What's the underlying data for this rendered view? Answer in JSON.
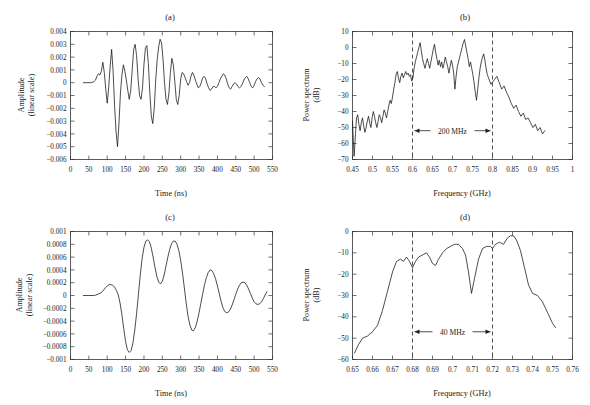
{
  "figure": {
    "panels": [
      {
        "id": "a",
        "title": "(a)"
      },
      {
        "id": "b",
        "title": "(b)"
      },
      {
        "id": "c",
        "title": "(c)"
      },
      {
        "id": "d",
        "title": "(d)"
      }
    ]
  },
  "axis_titles": {
    "time": "Time (ns)",
    "frequency": "Frequency (GHz)",
    "amplitude_line1": "Amplitude",
    "amplitude_line2": "(linear scale)",
    "power_line1": "Power spectrum",
    "power_line2": "(dB)"
  },
  "annotations": {
    "bandwidth_b": "200 MHz",
    "bandwidth_d": "40 MHz"
  },
  "chart_data": [
    {
      "type": "line",
      "panel": "a",
      "title": "(a)",
      "xlabel": "Time (ns)",
      "ylabel": "Amplitude (linear scale)",
      "xlim": [
        0,
        550
      ],
      "ylim": [
        -0.006,
        0.004
      ],
      "xticks": [
        0,
        50,
        100,
        150,
        200,
        250,
        300,
        350,
        400,
        450,
        500,
        550
      ],
      "xtick_labels": [
        "0",
        "50",
        "100",
        "150",
        "200",
        "250",
        "300",
        "350",
        "400",
        "450",
        "500",
        "550"
      ],
      "yticks": [
        -0.006,
        -0.005,
        -0.004,
        -0.003,
        -0.002,
        -0.001,
        0,
        0.001,
        0.002,
        0.003,
        0.004
      ],
      "ytick_labels": [
        "-0.006",
        "-0.005",
        "-0.004",
        "-0.003",
        "-0.002",
        "-0.001",
        "0",
        "0.001",
        "0.002",
        "0.003",
        "0.004"
      ],
      "grid": false,
      "legend": "none",
      "x": [
        35,
        45,
        55,
        62,
        68,
        72,
        76,
        80,
        84,
        88,
        92,
        96,
        100,
        104,
        108,
        112,
        116,
        120,
        124,
        128,
        132,
        136,
        140,
        144,
        148,
        152,
        156,
        160,
        164,
        168,
        172,
        176,
        180,
        184,
        188,
        192,
        196,
        200,
        204,
        208,
        212,
        216,
        220,
        224,
        228,
        232,
        236,
        240,
        244,
        248,
        252,
        256,
        260,
        264,
        268,
        272,
        276,
        280,
        284,
        288,
        292,
        296,
        300,
        304,
        308,
        312,
        316,
        320,
        324,
        328,
        332,
        336,
        340,
        344,
        348,
        352,
        356,
        360,
        364,
        368,
        372,
        376,
        380,
        384,
        388,
        392,
        396,
        400,
        404,
        408,
        412,
        416,
        420,
        424,
        428,
        432,
        436,
        440,
        444,
        448,
        452,
        456,
        460,
        464,
        468,
        472,
        476,
        480,
        484,
        488,
        492,
        496,
        500,
        504,
        508,
        512,
        516,
        520,
        524,
        528,
        532
      ],
      "y": [
        0,
        0,
        0,
        5e-05,
        0.0002,
        0.0005,
        0.0007,
        0.0006,
        0.0009,
        0.0016,
        0.0008,
        -0.0005,
        -0.0016,
        -0.0004,
        0.0013,
        0.0026,
        0.0009,
        -0.0018,
        -0.0038,
        -0.005,
        -0.0032,
        -0.0008,
        0.0006,
        0.0014,
        0.0009,
        0.0002,
        -0.0006,
        -0.0013,
        -0.0006,
        0.001,
        0.0026,
        0.003,
        0.0021,
        0.0003,
        -0.001,
        -0.0013,
        -0.0004,
        0.0014,
        0.0027,
        0.0029,
        0.0015,
        -0.0008,
        -0.0026,
        -0.0032,
        -0.002,
        0.0002,
        0.0018,
        0.0028,
        0.0034,
        0.0031,
        0.0018,
        0.0,
        -0.0013,
        -0.0017,
        -0.0008,
        0.0008,
        0.0019,
        0.0014,
        0.0001,
        -0.0013,
        -0.0017,
        -0.001,
        0.0003,
        0.0008,
        0.0007,
        0.0004,
        0.0001,
        -0.0002,
        0.0,
        0.0005,
        0.0008,
        0.0006,
        0.0002,
        -0.0001,
        -0.0004,
        -0.0003,
        0.0,
        0.0004,
        0.0005,
        0.0003,
        -0.0001,
        -0.0004,
        -0.0006,
        -0.0005,
        -0.0003,
        -0.0003,
        -0.0004,
        -0.0003,
        0.0,
        0.0003,
        0.0005,
        0.0007,
        0.0006,
        0.0003,
        -0.0001,
        -0.0004,
        -0.0005,
        -0.0003,
        -0.0001,
        0.0,
        -0.0001,
        -0.0003,
        -0.0004,
        -0.0003,
        -0.0001,
        0.0002,
        0.0004,
        0.0005,
        0.0003,
        0.0,
        -0.0003,
        -0.0004,
        -0.0002,
        0.0001,
        0.0003,
        0.0004,
        0.0003,
        0.0,
        -0.0002,
        -0.0003
      ]
    },
    {
      "type": "line",
      "panel": "b",
      "title": "(b)",
      "xlabel": "Frequency (GHz)",
      "ylabel": "Power spectrum (dB)",
      "xlim": [
        0.45,
        1.0
      ],
      "ylim": [
        -70,
        10
      ],
      "xticks": [
        0.45,
        0.5,
        0.55,
        0.6,
        0.65,
        0.7,
        0.75,
        0.8,
        0.85,
        0.9,
        0.95,
        1
      ],
      "xtick_labels": [
        "0.45",
        "0.5",
        "0.55",
        "0.6",
        "0.65",
        "0.7",
        "0.75",
        "0.8",
        "0.85",
        "0.9",
        "0.95",
        "1"
      ],
      "yticks": [
        -70,
        -60,
        -50,
        -40,
        -30,
        -20,
        -10,
        0,
        10
      ],
      "ytick_labels": [
        "-70",
        "-60",
        "-50",
        "-40",
        "-30",
        "-20",
        "-10",
        "0",
        "10"
      ],
      "grid": false,
      "legend": "none",
      "markers": {
        "dashed_x": [
          0.6,
          0.8
        ],
        "band_label": "200 MHz",
        "band_label_y": -52
      },
      "x": [
        0.45,
        0.452,
        0.454,
        0.456,
        0.458,
        0.46,
        0.463,
        0.466,
        0.469,
        0.472,
        0.475,
        0.478,
        0.481,
        0.484,
        0.487,
        0.49,
        0.493,
        0.496,
        0.499,
        0.502,
        0.505,
        0.508,
        0.511,
        0.514,
        0.517,
        0.52,
        0.523,
        0.526,
        0.529,
        0.532,
        0.535,
        0.538,
        0.541,
        0.544,
        0.547,
        0.55,
        0.553,
        0.556,
        0.559,
        0.562,
        0.565,
        0.568,
        0.571,
        0.574,
        0.577,
        0.58,
        0.583,
        0.586,
        0.589,
        0.592,
        0.595,
        0.598,
        0.601,
        0.604,
        0.607,
        0.61,
        0.613,
        0.616,
        0.619,
        0.622,
        0.625,
        0.628,
        0.631,
        0.634,
        0.637,
        0.64,
        0.643,
        0.646,
        0.649,
        0.652,
        0.655,
        0.658,
        0.661,
        0.664,
        0.667,
        0.67,
        0.673,
        0.676,
        0.679,
        0.682,
        0.685,
        0.688,
        0.691,
        0.694,
        0.697,
        0.7,
        0.703,
        0.706,
        0.709,
        0.712,
        0.715,
        0.718,
        0.721,
        0.724,
        0.727,
        0.73,
        0.733,
        0.736,
        0.739,
        0.742,
        0.745,
        0.748,
        0.751,
        0.754,
        0.757,
        0.76,
        0.763,
        0.766,
        0.769,
        0.772,
        0.775,
        0.778,
        0.781,
        0.784,
        0.787,
        0.79,
        0.793,
        0.796,
        0.799,
        0.805,
        0.811,
        0.817,
        0.823,
        0.829,
        0.835,
        0.841,
        0.847,
        0.853,
        0.859,
        0.865,
        0.871,
        0.877,
        0.883,
        0.889,
        0.895,
        0.901,
        0.907,
        0.913,
        0.919,
        0.925,
        0.931,
        0.937,
        0.943,
        0.949
      ],
      "y": [
        -46,
        -58,
        -68,
        -60,
        -52,
        -44,
        -42,
        -48,
        -52,
        -47,
        -44,
        -49,
        -53,
        -50,
        -46,
        -43,
        -47,
        -50,
        -44,
        -40,
        -43,
        -47,
        -50,
        -46,
        -42,
        -44,
        -47,
        -43,
        -39,
        -41,
        -44,
        -40,
        -36,
        -33,
        -35,
        -31,
        -26,
        -22,
        -17,
        -15,
        -19,
        -22,
        -18,
        -16,
        -19,
        -17,
        -15,
        -17,
        -16,
        -18,
        -17,
        -21,
        -19,
        -13,
        -9,
        -6,
        -3,
        0,
        3,
        -2,
        -7,
        -10,
        -13,
        -10,
        -7,
        -10,
        -13,
        -9,
        -5,
        -1,
        2,
        -3,
        -7,
        -11,
        -8,
        -12,
        -9,
        -13,
        -10,
        -6,
        -9,
        -12,
        -16,
        -12,
        -8,
        -11,
        -16,
        -26,
        -18,
        -12,
        -9,
        -6,
        -3,
        0,
        3,
        5,
        1,
        -3,
        -7,
        -12,
        -9,
        -13,
        -17,
        -22,
        -28,
        -33,
        -26,
        -19,
        -13,
        -9,
        -6,
        -4,
        -8,
        -13,
        -17,
        -19,
        -21,
        -23,
        -22,
        -20,
        -18,
        -22,
        -26,
        -24,
        -28,
        -31,
        -35,
        -38,
        -36,
        -40,
        -43,
        -41,
        -45,
        -44,
        -47,
        -50,
        -48,
        -52,
        -50,
        -54,
        -52
      ]
    },
    {
      "type": "line",
      "panel": "c",
      "title": "(c)",
      "xlabel": "Time (ns)",
      "ylabel": "Amplitude (linear scale)",
      "xlim": [
        0,
        550
      ],
      "ylim": [
        -0.001,
        0.001
      ],
      "xticks": [
        0,
        50,
        100,
        150,
        200,
        250,
        300,
        350,
        400,
        450,
        500,
        550
      ],
      "xtick_labels": [
        "0",
        "50",
        "100",
        "150",
        "200",
        "250",
        "300",
        "350",
        "400",
        "450",
        "500",
        "550"
      ],
      "yticks": [
        -0.001,
        -0.0008,
        -0.0006,
        -0.0004,
        -0.0002,
        0,
        0.0002,
        0.0004,
        0.0006,
        0.0008,
        0.001
      ],
      "ytick_labels": [
        "-0.001",
        "-0.0008",
        "-0.0006",
        "-0.0004",
        "-0.0002",
        "0",
        "0.0002",
        "0.0004",
        "0.0006",
        "0.0008",
        "0.001"
      ],
      "grid": false,
      "legend": "none",
      "x": [
        35,
        50,
        65,
        75,
        85,
        95,
        100,
        105,
        110,
        115,
        120,
        125,
        130,
        135,
        140,
        145,
        150,
        155,
        160,
        165,
        170,
        175,
        180,
        185,
        190,
        195,
        200,
        205,
        210,
        215,
        220,
        225,
        230,
        235,
        240,
        245,
        250,
        255,
        260,
        265,
        270,
        275,
        280,
        285,
        290,
        295,
        300,
        305,
        310,
        315,
        320,
        325,
        330,
        335,
        340,
        345,
        350,
        355,
        360,
        365,
        370,
        375,
        380,
        385,
        390,
        395,
        400,
        405,
        410,
        415,
        420,
        425,
        430,
        435,
        440,
        445,
        450,
        455,
        460,
        465,
        470,
        475,
        480,
        485,
        490,
        495,
        500,
        505,
        510,
        515,
        520,
        525,
        530,
        535
      ],
      "y": [
        0,
        0,
        0,
        2e-05,
        5e-05,
        0.00012,
        0.00015,
        0.00017,
        0.00017,
        0.00016,
        0.00013,
        8e-05,
        1e-05,
        -0.00012,
        -0.0003,
        -0.00052,
        -0.00072,
        -0.00085,
        -0.00089,
        -0.00086,
        -0.00074,
        -0.00054,
        -0.00028,
        2e-05,
        0.00032,
        0.00058,
        0.00075,
        0.00085,
        0.00087,
        0.00084,
        0.00074,
        0.0006,
        0.00044,
        0.0003,
        0.00021,
        0.00018,
        0.00022,
        0.00032,
        0.00046,
        0.0006,
        0.00072,
        0.00081,
        0.00085,
        0.00085,
        0.0008,
        0.0007,
        0.00055,
        0.00035,
        0.00012,
        -0.00012,
        -0.00032,
        -0.00046,
        -0.00054,
        -0.00055,
        -0.0005,
        -0.0004,
        -0.00027,
        -0.00012,
        3e-05,
        0.00017,
        0.00028,
        0.00036,
        0.0004,
        0.00039,
        0.00034,
        0.00026,
        0.00015,
        3e-05,
        -9e-05,
        -0.00019,
        -0.00025,
        -0.00027,
        -0.00026,
        -0.00022,
        -0.00015,
        -7e-05,
        2e-05,
        0.0001,
        0.00016,
        0.0002,
        0.00021,
        0.0002,
        0.00016,
        0.0001,
        3e-05,
        -4e-05,
        -0.0001,
        -0.00013,
        -0.00014,
        -0.00013,
        -0.0001,
        -5e-05,
        1e-05,
        6e-05
      ]
    },
    {
      "type": "line",
      "panel": "d",
      "title": "(d)",
      "xlabel": "Frequency (GHz)",
      "ylabel": "Power spectrum (dB)",
      "xlim": [
        0.65,
        0.76
      ],
      "ylim": [
        -60,
        0
      ],
      "xticks": [
        0.65,
        0.66,
        0.67,
        0.68,
        0.69,
        0.7,
        0.71,
        0.72,
        0.73,
        0.74,
        0.75,
        0.76
      ],
      "xtick_labels": [
        "0.65",
        "0.66",
        "0.67",
        "0.68",
        "0.69",
        "0.7",
        "0.71",
        "0.72",
        "0.73",
        "0.74",
        "0.75",
        "0.76"
      ],
      "yticks": [
        -60,
        -50,
        -40,
        -30,
        -20,
        -10,
        0
      ],
      "ytick_labels": [
        "-60",
        "-50",
        "-40",
        "-30",
        "-20",
        "-10",
        "0"
      ],
      "grid": false,
      "legend": "none",
      "markers": {
        "dashed_x": [
          0.68,
          0.72
        ],
        "band_label": "40 MHz",
        "band_label_y": -47
      },
      "x": [
        0.651,
        0.653,
        0.655,
        0.6575,
        0.66,
        0.6625,
        0.665,
        0.6675,
        0.67,
        0.672,
        0.674,
        0.6755,
        0.677,
        0.6785,
        0.68,
        0.6815,
        0.683,
        0.685,
        0.687,
        0.6885,
        0.69,
        0.6915,
        0.693,
        0.695,
        0.697,
        0.699,
        0.701,
        0.703,
        0.705,
        0.7065,
        0.708,
        0.7095,
        0.711,
        0.713,
        0.715,
        0.717,
        0.719,
        0.72,
        0.7215,
        0.7235,
        0.7255,
        0.7275,
        0.729,
        0.7305,
        0.732,
        0.734,
        0.736,
        0.738,
        0.74,
        0.7425,
        0.745,
        0.7475,
        0.75,
        0.7515
      ],
      "y": [
        -57,
        -53,
        -50,
        -49,
        -47,
        -44,
        -37,
        -28,
        -19,
        -14,
        -13,
        -14,
        -12,
        -14,
        -17,
        -14,
        -12,
        -11,
        -10,
        -12,
        -15,
        -16,
        -13,
        -10,
        -8,
        -7,
        -6,
        -6,
        -8,
        -11,
        -19,
        -29,
        -22,
        -13,
        -8,
        -7,
        -7,
        -8,
        -6,
        -5,
        -6,
        -3,
        -2,
        -2,
        -4,
        -9,
        -17,
        -25,
        -29,
        -30,
        -33,
        -38,
        -43,
        -45
      ]
    }
  ]
}
